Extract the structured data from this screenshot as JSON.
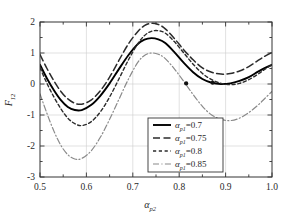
{
  "chart_data": {
    "type": "line",
    "title": "",
    "xlabel": "alpha_p2",
    "xlabel_base": "α",
    "xlabel_sub": "p2",
    "ylabel": "F12",
    "ylabel_base": "F",
    "ylabel_sub": "12",
    "xlim": [
      0.5,
      1.0
    ],
    "ylim": [
      -3,
      2
    ],
    "xticks": [
      0.5,
      0.6,
      0.7,
      0.8,
      0.9,
      1.0
    ],
    "xticklabels": [
      "0.5",
      "0.6",
      "0.7",
      "0.8",
      "0.9",
      "1.0"
    ],
    "xminorticks": [
      0.55,
      0.65,
      0.75,
      0.85,
      0.95
    ],
    "yticks": [
      -3,
      -2,
      -1,
      0,
      1,
      2
    ],
    "yticklabels": [
      "-3",
      "-2",
      "-1",
      "0",
      "1",
      "2"
    ],
    "yminorticks": [
      -2.5,
      -1.5,
      -0.5,
      0.5,
      1.5
    ],
    "grid": true,
    "grid_color": "#cccccc",
    "axis_color": "#333333",
    "legend_position": "lower-center-right",
    "series": [
      {
        "name": "alpha_p1=0.7",
        "label_base": "α",
        "label_sub": "p1",
        "label_value": "=0.7",
        "style": "solid",
        "color": "#000000",
        "width": 1.9,
        "x": [
          0.5,
          0.515,
          0.53,
          0.545,
          0.56,
          0.575,
          0.59,
          0.61,
          0.63,
          0.65,
          0.67,
          0.69,
          0.71,
          0.725,
          0.74,
          0.755,
          0.77,
          0.79,
          0.81,
          0.83,
          0.85,
          0.87,
          0.89,
          0.91,
          0.93,
          0.95,
          0.97,
          0.985,
          1.0
        ],
        "y": [
          0.62,
          0.18,
          -0.2,
          -0.52,
          -0.74,
          -0.84,
          -0.84,
          -0.68,
          -0.38,
          0.02,
          0.48,
          0.92,
          1.28,
          1.43,
          1.48,
          1.44,
          1.32,
          1.02,
          0.68,
          0.38,
          0.16,
          0.04,
          0.0,
          0.02,
          0.1,
          0.22,
          0.4,
          0.52,
          0.62
        ]
      },
      {
        "name": "alpha_p1=0.75",
        "label_base": "α",
        "label_sub": "p1",
        "label_value": "=0.75",
        "style": "dashed",
        "color": "#2b2b2b",
        "width": 1.5,
        "x": [
          0.5,
          0.515,
          0.53,
          0.545,
          0.56,
          0.575,
          0.59,
          0.61,
          0.63,
          0.65,
          0.67,
          0.69,
          0.71,
          0.725,
          0.74,
          0.755,
          0.77,
          0.79,
          0.81,
          0.83,
          0.85,
          0.87,
          0.89,
          0.91,
          0.93,
          0.95,
          0.97,
          0.985,
          1.0
        ],
        "y": [
          0.95,
          0.5,
          0.1,
          -0.24,
          -0.48,
          -0.62,
          -0.65,
          -0.52,
          -0.22,
          0.22,
          0.76,
          1.28,
          1.68,
          1.88,
          1.96,
          1.92,
          1.78,
          1.46,
          1.1,
          0.78,
          0.52,
          0.38,
          0.32,
          0.34,
          0.42,
          0.56,
          0.76,
          0.9,
          1.02
        ]
      },
      {
        "name": "alpha_p1=0.8",
        "label_base": "α",
        "label_sub": "p1",
        "label_value": "=0.8",
        "style": "densely-dashed",
        "color": "#2b2b2b",
        "width": 1.4,
        "x": [
          0.5,
          0.515,
          0.53,
          0.545,
          0.56,
          0.575,
          0.59,
          0.61,
          0.63,
          0.65,
          0.67,
          0.69,
          0.71,
          0.725,
          0.74,
          0.755,
          0.77,
          0.79,
          0.81,
          0.83,
          0.85,
          0.87,
          0.89,
          0.91,
          0.93,
          0.95,
          0.97,
          0.985,
          1.0
        ],
        "y": [
          0.52,
          0.02,
          -0.42,
          -0.8,
          -1.1,
          -1.28,
          -1.34,
          -1.22,
          -0.9,
          -0.42,
          0.16,
          0.76,
          1.28,
          1.56,
          1.7,
          1.72,
          1.64,
          1.36,
          1.0,
          0.64,
          0.34,
          0.14,
          0.02,
          -0.02,
          0.02,
          0.14,
          0.32,
          0.48,
          0.62
        ]
      },
      {
        "name": "alpha_p1=0.85",
        "label_base": "α",
        "label_sub": "p1",
        "label_value": "=0.85",
        "style": "dashdot",
        "color": "#8a8a8a",
        "width": 1.2,
        "x": [
          0.5,
          0.515,
          0.53,
          0.545,
          0.56,
          0.575,
          0.59,
          0.61,
          0.63,
          0.65,
          0.67,
          0.69,
          0.71,
          0.725,
          0.74,
          0.755,
          0.77,
          0.79,
          0.81,
          0.83,
          0.85,
          0.87,
          0.89,
          0.91,
          0.93,
          0.95,
          0.97,
          0.985,
          1.0
        ],
        "y": [
          -0.32,
          -0.95,
          -1.52,
          -1.98,
          -2.28,
          -2.42,
          -2.4,
          -2.16,
          -1.72,
          -1.14,
          -0.5,
          0.14,
          0.68,
          0.92,
          1.0,
          0.96,
          0.82,
          0.48,
          0.08,
          -0.34,
          -0.72,
          -1.0,
          -1.14,
          -1.18,
          -1.1,
          -0.92,
          -0.68,
          -0.46,
          -0.24
        ]
      }
    ],
    "markers": [
      {
        "x": 0.815,
        "y": 0.02,
        "series": "alpha_p1=0.85",
        "shape": "filled-circle",
        "color": "#111111"
      },
      {
        "x": 0.872,
        "y": 0.04,
        "series": "alpha_p1=0.85",
        "shape": "filled-circle",
        "color": "#111111"
      }
    ],
    "legend_entries": [
      {
        "label_base": "α",
        "label_sub": "p1",
        "label_value": "=0.7",
        "style": "solid"
      },
      {
        "label_base": "α",
        "label_sub": "p1",
        "label_value": "=0.75",
        "style": "dashed"
      },
      {
        "label_base": "α",
        "label_sub": "p1",
        "label_value": "=0.8",
        "style": "densely-dashed"
      },
      {
        "label_base": "α",
        "label_sub": "p1",
        "label_value": "=0.85",
        "style": "dashdot"
      }
    ]
  }
}
